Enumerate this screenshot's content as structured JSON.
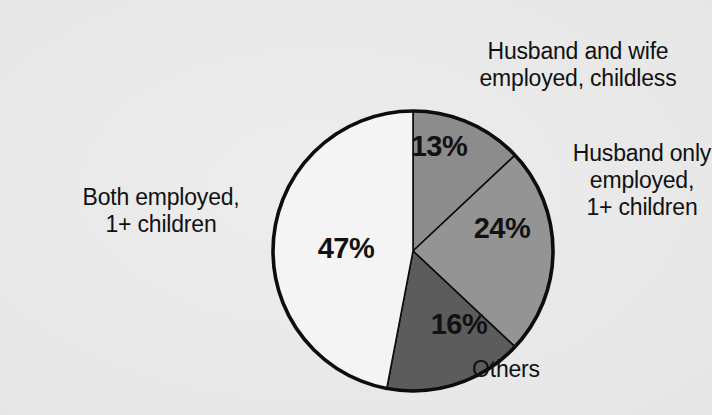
{
  "chart_data": {
    "type": "pie",
    "title": "",
    "subtitle": "",
    "xlabel": "",
    "ylabel": "",
    "legend_position": "callout-labels",
    "grid": false,
    "units": "percent",
    "start_angle_deg": 0,
    "direction": "clockwise",
    "categories": [
      "Husband and wife employed, childless",
      "Husband only employed, 1+ children",
      "Others",
      "Both employed, 1+ children"
    ],
    "values": [
      13,
      24,
      16,
      47
    ],
    "value_labels": [
      "13%",
      "24%",
      "16%",
      "47%"
    ],
    "slice_colors": [
      "#8c8c8c",
      "#949494",
      "#5c5c5c",
      "#f4f4f4"
    ],
    "slices": [
      {
        "label": "Husband and wife employed, childless",
        "value": 13,
        "value_label": "13%",
        "color": "#8c8c8c",
        "start_deg": 0,
        "end_deg": 46.8
      },
      {
        "label": "Husband only employed, 1+ children",
        "value": 24,
        "value_label": "24%",
        "color": "#949494",
        "start_deg": 46.8,
        "end_deg": 133.2
      },
      {
        "label": "Others",
        "value": 16,
        "value_label": "16%",
        "color": "#5c5c5c",
        "start_deg": 133.2,
        "end_deg": 190.8
      },
      {
        "label": "Both employed, 1+ children",
        "value": 47,
        "value_label": "47%",
        "color": "#f4f4f4",
        "start_deg": 190.8,
        "end_deg": 360
      }
    ]
  },
  "labels": {
    "top": "Husband and wife\nemployed, childless",
    "right": "Husband only\nemployed,\n1+ children",
    "left": "Both employed,\n1+ children",
    "bottom": "Others"
  },
  "slice_values": {
    "wife_childless": "13%",
    "husband_only": "24%",
    "others": "16%",
    "both_employed": "47%"
  },
  "colors": {
    "background": "#e9e9e9",
    "outline": "#0d0d0d",
    "text": "#111111",
    "slice_wife_childless": "#8c8c8c",
    "slice_husband_only": "#949494",
    "slice_others": "#5c5c5c",
    "slice_both_employed": "#f4f4f4"
  }
}
